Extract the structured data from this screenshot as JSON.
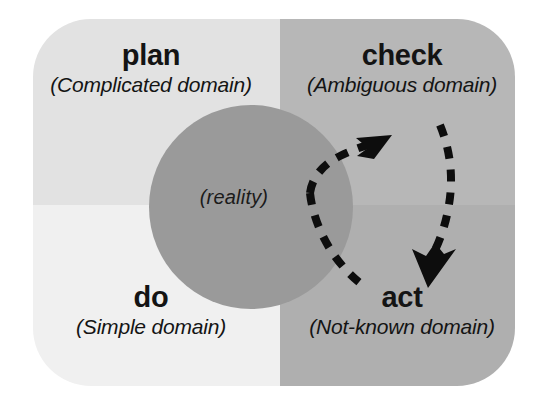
{
  "diagram": {
    "title_text": "",
    "card": {
      "corner_radius_px": 58,
      "background_colors": {
        "plan_quadrant": "#e2e2e2",
        "check_quadrant": "#b7b7b7",
        "do_quadrant": "#f0f0f0",
        "act_quadrant": "#afafaf"
      }
    },
    "quadrants": [
      {
        "key": "plan",
        "title": "plan",
        "subtitle": "(Complicated domain)",
        "color": "#e2e2e2"
      },
      {
        "key": "check",
        "title": "check",
        "subtitle": "(Ambiguous domain)",
        "color": "#b7b7b7"
      },
      {
        "key": "do",
        "title": "do",
        "subtitle": "(Simple domain)",
        "color": "#f0f0f0"
      },
      {
        "key": "act",
        "title": "act",
        "subtitle": "(Not-known domain)",
        "color": "#afafaf"
      }
    ],
    "center": {
      "label": "(reality)",
      "color": "#9a9a9a",
      "shape": "circle"
    },
    "arrows": [
      {
        "name": "arrow-to-check",
        "style": "dashed",
        "color": "#0d0d0d",
        "from": "reality-circle-lower-left",
        "to": "check-quadrant"
      },
      {
        "name": "arrow-to-act",
        "style": "dashed",
        "color": "#0d0d0d",
        "from": "check-quadrant",
        "to": "act-quadrant"
      }
    ],
    "text_color": "#141414"
  }
}
